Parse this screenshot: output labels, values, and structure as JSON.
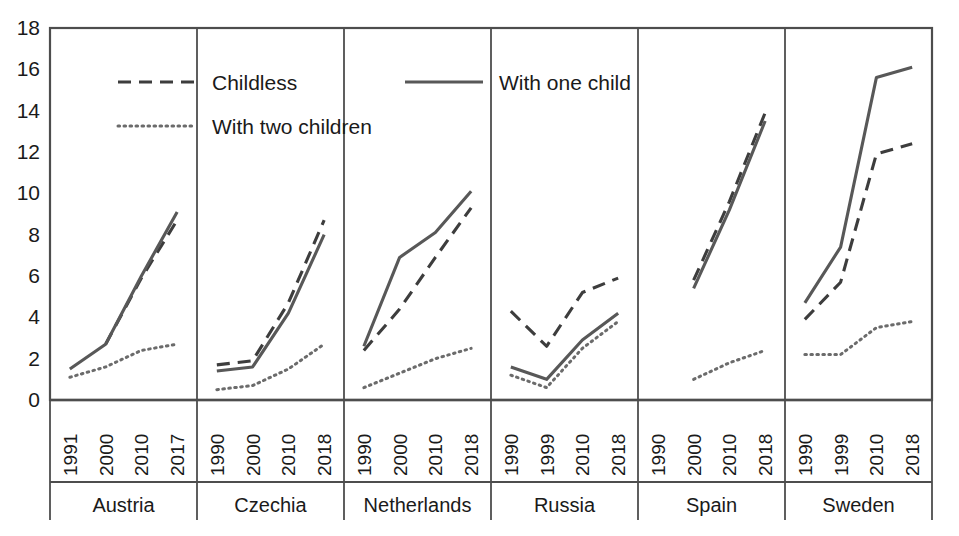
{
  "chart_data": {
    "type": "line",
    "title": "",
    "subtitle": "",
    "xlabel": "",
    "ylabel": "",
    "ylim": [
      0,
      18
    ],
    "ytick_step": 2,
    "yticks": [
      "0",
      "2",
      "4",
      "6",
      "8",
      "10",
      "12",
      "14",
      "16",
      "18"
    ],
    "grid": false,
    "legend_position": "top-left-inside",
    "legend": [
      {
        "name": "Childless",
        "style": "dashed"
      },
      {
        "name": "With one child",
        "style": "solid"
      },
      {
        "name": "With two children",
        "style": "dotted"
      }
    ],
    "panel_axis": "grouped-by-country",
    "groups": [
      {
        "label": "Austria",
        "x": [
          "1991",
          "2000",
          "2010",
          "2017"
        ],
        "series": [
          {
            "name": "Childless",
            "style": "dashed",
            "values": [
              null,
              2.7,
              5.9,
              8.7
            ]
          },
          {
            "name": "With one child",
            "style": "solid",
            "values": [
              1.5,
              2.7,
              6.0,
              9.1
            ]
          },
          {
            "name": "With two children",
            "style": "dotted",
            "values": [
              1.1,
              1.6,
              2.4,
              2.7
            ]
          }
        ]
      },
      {
        "label": "Czechia",
        "x": [
          "1990",
          "2000",
          "2010",
          "2018"
        ],
        "series": [
          {
            "name": "Childless",
            "style": "dashed",
            "values": [
              1.7,
              1.9,
              4.7,
              8.7
            ]
          },
          {
            "name": "With one child",
            "style": "solid",
            "values": [
              1.4,
              1.6,
              4.2,
              8.0
            ]
          },
          {
            "name": "With two children",
            "style": "dotted",
            "values": [
              0.5,
              0.7,
              1.5,
              2.7
            ]
          }
        ]
      },
      {
        "label": "Netherlands",
        "x": [
          "1990",
          "2000",
          "2010",
          "2018"
        ],
        "series": [
          {
            "name": "Childless",
            "style": "dashed",
            "values": [
              2.4,
              4.4,
              6.9,
              9.3
            ]
          },
          {
            "name": "With one child",
            "style": "solid",
            "values": [
              2.6,
              6.9,
              8.1,
              10.1
            ]
          },
          {
            "name": "With two children",
            "style": "dotted",
            "values": [
              0.6,
              1.3,
              2.0,
              2.5
            ]
          }
        ]
      },
      {
        "label": "Russia",
        "x": [
          "1990",
          "1999",
          "2010",
          "2018"
        ],
        "series": [
          {
            "name": "Childless",
            "style": "dashed",
            "values": [
              4.3,
              2.6,
              5.2,
              5.9
            ]
          },
          {
            "name": "With one child",
            "style": "solid",
            "values": [
              1.6,
              1.0,
              2.9,
              4.2
            ]
          },
          {
            "name": "With two children",
            "style": "dotted",
            "values": [
              1.2,
              0.6,
              2.5,
              3.8
            ]
          }
        ]
      },
      {
        "label": "Spain",
        "x": [
          "1990",
          "2000",
          "2010",
          "2018"
        ],
        "series": [
          {
            "name": "Childless",
            "style": "dashed",
            "values": [
              null,
              5.8,
              9.6,
              13.9
            ]
          },
          {
            "name": "With one child",
            "style": "solid",
            "values": [
              null,
              5.4,
              9.2,
              13.5
            ]
          },
          {
            "name": "With two children",
            "style": "dotted",
            "values": [
              null,
              1.0,
              1.8,
              2.4
            ]
          }
        ]
      },
      {
        "label": "Sweden",
        "x": [
          "1990",
          "1999",
          "2010",
          "2018"
        ],
        "series": [
          {
            "name": "Childless",
            "style": "dashed",
            "values": [
              3.9,
              5.7,
              11.9,
              12.4
            ]
          },
          {
            "name": "With one child",
            "style": "solid",
            "values": [
              4.7,
              7.4,
              15.6,
              16.1
            ]
          },
          {
            "name": "With two children",
            "style": "dotted",
            "values": [
              2.2,
              2.2,
              3.5,
              3.8
            ]
          }
        ]
      }
    ]
  },
  "colors": {
    "solid": "#585858",
    "dashed": "#3d3d3d",
    "dotted": "#6b6b6b",
    "axis": "#4d4d4d",
    "text": "#1a1a1a",
    "background": "#ffffff"
  }
}
